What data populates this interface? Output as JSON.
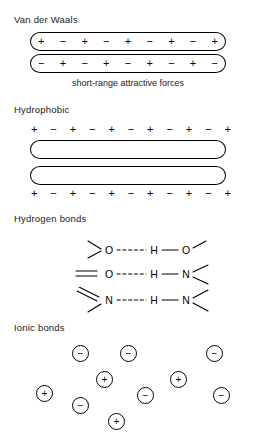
{
  "figure": {
    "background_color": "#ffffff",
    "ink_color": "#000000"
  },
  "sections": [
    {
      "id": "van-der-waals",
      "heading": "Van der Waals",
      "caption": "short-range attractive forces",
      "surfaces": [
        {
          "id": "vdw-top-surface",
          "signs": [
            "+",
            "−",
            "+",
            "−",
            "+",
            "−",
            "+",
            "−",
            "+"
          ],
          "signs_inside": true
        },
        {
          "id": "vdw-bottom-surface",
          "signs": [
            "−",
            "+",
            "−",
            "+",
            "−",
            "+",
            "−",
            "+",
            "−"
          ],
          "signs_inside": true
        }
      ]
    },
    {
      "id": "hydrophobic",
      "heading": "Hydrophobic",
      "caption": "",
      "surfaces": [
        {
          "id": "hydrophobic-top-surface",
          "signs": [
            "+",
            "−",
            "+",
            "−",
            "+",
            "−",
            "+",
            "−",
            "+",
            "−",
            "+"
          ],
          "signs_inside": false
        },
        {
          "id": "hydrophobic-bottom-surface",
          "signs": [
            "+",
            "−",
            "+",
            "−",
            "+",
            "−",
            "+",
            "−",
            "+",
            "−",
            "+"
          ],
          "signs_inside": false
        }
      ]
    },
    {
      "id": "hydrogen-bonds",
      "heading": "Hydrogen bonds",
      "caption": "",
      "bonds": [
        {
          "id": "hbond-oh-o",
          "donor_atom": "O",
          "hydrogen": "H",
          "acceptor_atom": "O",
          "left_bond": "single-branch",
          "right_bond": "single-branch",
          "bridge": "dashed"
        },
        {
          "id": "hbond-oh-n",
          "donor_atom": "O",
          "hydrogen": "H",
          "acceptor_atom": "N",
          "left_bond": "double",
          "right_bond": "double-branch",
          "bridge": "dashed"
        },
        {
          "id": "hbond-nh-n",
          "donor_atom": "N",
          "hydrogen": "H",
          "acceptor_atom": "N",
          "left_bond": "double-branch",
          "right_bond": "double-branch",
          "bridge": "dashed"
        }
      ]
    },
    {
      "id": "ionic-bonds",
      "heading": "Ionic bonds",
      "caption": "",
      "ions": [
        {
          "id": "ion-1",
          "charge": "−",
          "x": 72,
          "y": 345
        },
        {
          "id": "ion-2",
          "charge": "−",
          "x": 120,
          "y": 345
        },
        {
          "id": "ion-3",
          "charge": "−",
          "x": 206,
          "y": 345
        },
        {
          "id": "ion-4",
          "charge": "+",
          "x": 96,
          "y": 371
        },
        {
          "id": "ion-5",
          "charge": "+",
          "x": 170,
          "y": 371
        },
        {
          "id": "ion-6",
          "charge": "+",
          "x": 36,
          "y": 385
        },
        {
          "id": "ion-7",
          "charge": "−",
          "x": 137,
          "y": 387
        },
        {
          "id": "ion-8",
          "charge": "−",
          "x": 213,
          "y": 387
        },
        {
          "id": "ion-9",
          "charge": "−",
          "x": 72,
          "y": 397
        },
        {
          "id": "ion-10",
          "charge": "+",
          "x": 108,
          "y": 413
        }
      ]
    }
  ],
  "headings": {
    "van_der_waals": "Van der Waals",
    "hydrophobic": "Hydrophobic",
    "hydrogen_bonds": "Hydrogen bonds",
    "ionic_bonds": "Ionic bonds"
  },
  "captions": {
    "short_range": "short-range attractive forces"
  },
  "atom_labels": {
    "oxygen": "O",
    "hydrogen": "H",
    "nitrogen": "N"
  }
}
